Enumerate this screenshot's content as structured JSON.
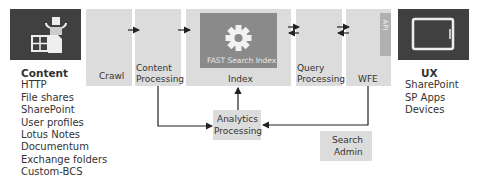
{
  "content": {
    "icon": "content-sources-icon",
    "title": "Content",
    "items": [
      "HTTP",
      "File shares",
      "SharePoint",
      "User profiles",
      "Lotus Notes",
      "Documentum",
      "Exchange folders",
      "Custom-BCS"
    ]
  },
  "pipeline": {
    "crawl": "Crawl",
    "content_processing_1": "Content",
    "content_processing_2": "Processing",
    "index": "Index",
    "fast_search_index": "FAST Search Index",
    "index_icon": "gear-icon",
    "query_processing_1": "Query",
    "query_processing_2": "Processing",
    "wfe": "WFE",
    "api": "API"
  },
  "analytics": {
    "line1": "Analytics",
    "line2": "Processing"
  },
  "admin": {
    "line1": "Search",
    "line2": "Admin"
  },
  "ux": {
    "icon": "tablet-icon",
    "title": "UX",
    "items": [
      "SharePoint",
      "SP Apps",
      "Devices"
    ]
  },
  "colors": {
    "dark": "#404040",
    "light": "#dcdcdc",
    "inner": "#8a8a8a",
    "api": "#b0b0b0",
    "arrow": "#222222"
  }
}
